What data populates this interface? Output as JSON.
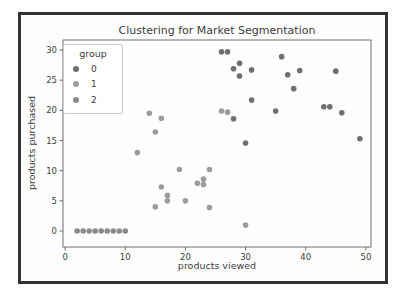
{
  "chart_data": {
    "type": "scatter",
    "title": "Clustering for Market Segmentation",
    "xlabel": "products viewed",
    "ylabel": "products purchased",
    "xlim": [
      -0.35,
      50.85
    ],
    "ylim": [
      -2.65,
      31.66
    ],
    "xticks": [
      0,
      10,
      20,
      30,
      40,
      50
    ],
    "yticks": [
      0,
      5,
      10,
      15,
      20,
      25,
      30
    ],
    "grid": false,
    "legend": {
      "title": "group",
      "position": "upper-left"
    },
    "series": [
      {
        "name": "0",
        "color": "#6f6f6f",
        "points": [
          [
            26,
            29.7
          ],
          [
            27,
            29.7
          ],
          [
            36,
            28.9
          ],
          [
            29,
            27.8
          ],
          [
            28,
            26.9
          ],
          [
            31,
            26.7
          ],
          [
            39,
            26.6
          ],
          [
            45,
            26.5
          ],
          [
            37,
            25.9
          ],
          [
            29,
            25.7
          ],
          [
            38,
            23.6
          ],
          [
            31,
            21.7
          ],
          [
            43,
            20.6
          ],
          [
            44,
            20.6
          ],
          [
            35,
            19.9
          ],
          [
            46,
            19.6
          ],
          [
            28,
            18.6
          ],
          [
            49,
            15.3
          ],
          [
            30,
            14.6
          ]
        ]
      },
      {
        "name": "1",
        "color": "#9c9c9c",
        "points": [
          [
            26,
            19.9
          ],
          [
            27,
            19.7
          ],
          [
            14,
            19.5
          ],
          [
            16,
            18.7
          ],
          [
            15,
            16.4
          ],
          [
            12,
            13.0
          ],
          [
            19,
            10.2
          ],
          [
            24,
            10.2
          ],
          [
            23,
            8.6
          ],
          [
            22,
            7.9
          ],
          [
            23,
            7.7
          ],
          [
            16,
            7.3
          ],
          [
            17,
            5.9
          ],
          [
            17,
            5.0
          ],
          [
            20,
            5.0
          ],
          [
            15,
            4.0
          ],
          [
            24,
            3.9
          ],
          [
            30,
            1.0
          ]
        ]
      },
      {
        "name": "2",
        "color": "#8a8a8a",
        "points": [
          [
            2,
            0
          ],
          [
            3,
            0
          ],
          [
            4,
            0
          ],
          [
            5,
            0
          ],
          [
            6,
            0
          ],
          [
            7,
            0
          ],
          [
            8,
            0
          ],
          [
            9,
            0
          ],
          [
            10,
            0
          ]
        ]
      }
    ]
  },
  "colors": {
    "frame": "#333333",
    "spine": "#6e6e6e",
    "text": "#3d3d3d",
    "legend_border": "#c8c8c8",
    "background": "#ffffff"
  }
}
